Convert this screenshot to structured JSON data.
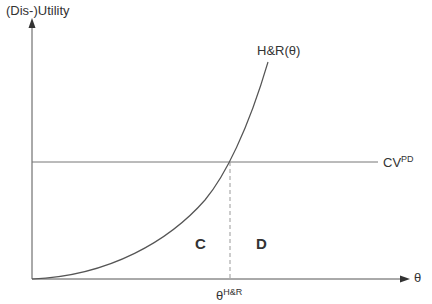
{
  "diagram": {
    "y_axis_label": "(Dis-)Utility",
    "x_axis_label": "θ",
    "curve_label": "H&R(θ)",
    "hline_label_base": "CV",
    "hline_label_sup": "PD",
    "threshold_label_base": "θ",
    "threshold_label_sup": "H&R",
    "region_left": "C",
    "region_right": "D",
    "colors": {
      "line": "#555555",
      "axis": "#444444",
      "text": "#333333",
      "dashed": "#999999"
    }
  }
}
